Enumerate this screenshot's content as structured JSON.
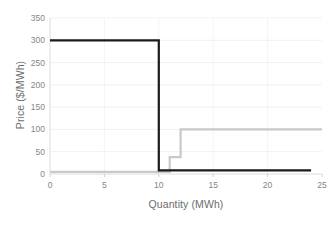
{
  "chart_data": {
    "type": "line",
    "title": "",
    "xlabel": "Quantity (MWh)",
    "ylabel": "Price ($/MWh)",
    "xlim": [
      0,
      25
    ],
    "ylim": [
      0,
      350
    ],
    "xticks": [
      0,
      5,
      10,
      15,
      20,
      25
    ],
    "yticks": [
      0,
      50,
      100,
      150,
      200,
      250,
      300,
      350
    ],
    "grid": true,
    "grid_axis": "y",
    "legend": "none",
    "series": [
      {
        "name": "demand-curve",
        "color": "#1a1a1a",
        "linewidth": 2.2,
        "step": "post",
        "x": [
          0,
          10,
          10,
          24
        ],
        "y": [
          300,
          300,
          8,
          8
        ],
        "points": [
          {
            "x": 0,
            "y": 300
          },
          {
            "x": 10,
            "y": 300
          },
          {
            "x": 10,
            "y": 8
          },
          {
            "x": 24,
            "y": 8
          }
        ]
      },
      {
        "name": "supply-curve",
        "color": "#c9c9c9",
        "linewidth": 2.2,
        "step": "post",
        "x": [
          0,
          11,
          11,
          12,
          12,
          25
        ],
        "y": [
          5,
          5,
          38,
          38,
          100,
          100
        ],
        "points": [
          {
            "x": 0,
            "y": 5
          },
          {
            "x": 11,
            "y": 5
          },
          {
            "x": 11,
            "y": 38
          },
          {
            "x": 12,
            "y": 38
          },
          {
            "x": 12,
            "y": 100
          },
          {
            "x": 25,
            "y": 100
          }
        ]
      }
    ],
    "xtick_labels": [
      "0",
      "5",
      "10",
      "15",
      "20",
      "25"
    ],
    "ytick_labels": [
      "0",
      "50",
      "100",
      "150",
      "200",
      "250",
      "300",
      "350"
    ]
  },
  "axes": {
    "x_title": "Quantity (MWh)",
    "y_title": "Price ($/MWh)"
  },
  "colors": {
    "demand": "#1a1a1a",
    "supply": "#c9c9c9",
    "grid": "#f0f0f0",
    "axis": "#d9d9d9",
    "text": "#868686",
    "title_text": "#6d6d6d",
    "background": "#ffffff"
  }
}
